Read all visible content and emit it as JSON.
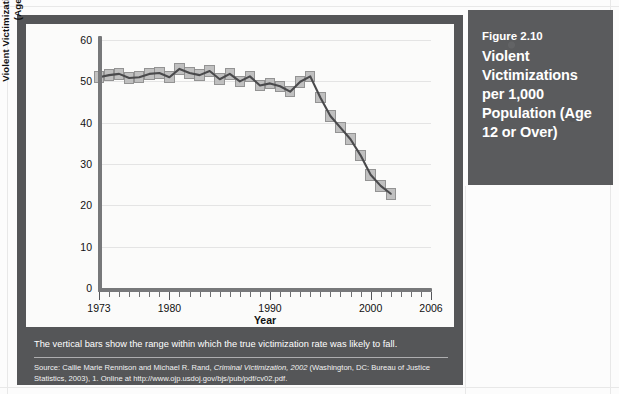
{
  "figure_label": {
    "number": "Figure 2.10",
    "title": "Violent Victimizations per 1,000 Population (Age 12 or Over)"
  },
  "caption": "The vertical bars show the range within which the true victimization rate was likely to fall.",
  "source": {
    "prefix": "Source: Callie Marie Rennison and Michael R. Rand, ",
    "italic": "Criminal Victimization, 2002",
    "suffix": " (Washington, DC: Bureau of Justice Statistics, 2003), 1. Online at http://www.ojp.usdoj.gov/bjs/pub/pdf/cv02.pdf."
  },
  "colors": {
    "panel": "#555658",
    "label_block": "#5a5b5d",
    "chart_background": "#fbfbfa",
    "axis": "#77787a",
    "gridline": "#e4e4e4",
    "bar_fill": "#bdbdbd",
    "bar_stroke": "#8e8e8e",
    "line": "#4a4a4c"
  },
  "chart_data": {
    "type": "line",
    "title": "",
    "xlabel": "Year",
    "ylabel": "Violent Victimizations per 1,000 Population (Age 12 or Over)",
    "ylabel_line1": "Violent Victimizations per 1,000 Population",
    "ylabel_line2": "(Age 12 or Over)",
    "xlim": [
      1973,
      2006
    ],
    "ylim": [
      0,
      60
    ],
    "ytick_values": [
      0,
      10,
      20,
      30,
      40,
      50,
      60
    ],
    "ytick_labels": [
      "0",
      "10",
      "20",
      "30",
      "40",
      "50",
      "60"
    ],
    "xtick_step": 1,
    "xtick_labeled": [
      1973,
      1980,
      1990,
      2000,
      2006
    ],
    "xtick_labels": [
      "1973",
      "1980",
      "1990",
      "2000",
      "2006"
    ],
    "grid": "horizontal",
    "legend": "none",
    "annotation": "The vertical bars show the range within which the true victimization rate was likely to fall.",
    "x": [
      1973,
      1974,
      1975,
      1976,
      1977,
      1978,
      1979,
      1980,
      1981,
      1982,
      1983,
      1984,
      1985,
      1986,
      1987,
      1988,
      1989,
      1990,
      1991,
      1992,
      1993,
      1994,
      1995,
      1996,
      1997,
      1998,
      1999,
      2000,
      2001,
      2002
    ],
    "values": [
      51.0,
      51.5,
      51.8,
      50.8,
      51.0,
      51.8,
      52.0,
      51.0,
      53.0,
      52.0,
      51.5,
      52.5,
      50.5,
      51.8,
      50.0,
      51.2,
      49.0,
      49.5,
      48.8,
      47.5,
      49.9,
      51.2,
      46.1,
      41.6,
      38.8,
      36.0,
      32.1,
      27.4,
      24.7,
      22.8
    ],
    "range_bars": [
      {
        "x": 1973,
        "low": 49.6,
        "high": 52.4
      },
      {
        "x": 1974,
        "low": 50.1,
        "high": 52.9
      },
      {
        "x": 1975,
        "low": 50.4,
        "high": 53.2
      },
      {
        "x": 1976,
        "low": 49.4,
        "high": 52.2
      },
      {
        "x": 1977,
        "low": 49.6,
        "high": 52.4
      },
      {
        "x": 1978,
        "low": 50.4,
        "high": 53.2
      },
      {
        "x": 1979,
        "low": 50.6,
        "high": 53.4
      },
      {
        "x": 1980,
        "low": 49.6,
        "high": 52.4
      },
      {
        "x": 1981,
        "low": 51.6,
        "high": 54.4
      },
      {
        "x": 1982,
        "low": 50.6,
        "high": 53.4
      },
      {
        "x": 1983,
        "low": 50.1,
        "high": 52.9
      },
      {
        "x": 1984,
        "low": 51.1,
        "high": 53.9
      },
      {
        "x": 1985,
        "low": 49.1,
        "high": 51.9
      },
      {
        "x": 1986,
        "low": 50.4,
        "high": 53.2
      },
      {
        "x": 1987,
        "low": 48.6,
        "high": 51.4
      },
      {
        "x": 1988,
        "low": 49.8,
        "high": 52.6
      },
      {
        "x": 1989,
        "low": 47.6,
        "high": 50.4
      },
      {
        "x": 1990,
        "low": 48.1,
        "high": 50.9
      },
      {
        "x": 1991,
        "low": 47.4,
        "high": 50.2
      },
      {
        "x": 1992,
        "low": 46.1,
        "high": 48.9
      },
      {
        "x": 1993,
        "low": 48.5,
        "high": 51.3
      },
      {
        "x": 1994,
        "low": 49.8,
        "high": 52.6
      },
      {
        "x": 1995,
        "low": 44.7,
        "high": 47.5
      },
      {
        "x": 1996,
        "low": 40.2,
        "high": 43.0
      },
      {
        "x": 1997,
        "low": 37.4,
        "high": 40.2
      },
      {
        "x": 1998,
        "low": 34.6,
        "high": 37.4
      },
      {
        "x": 1999,
        "low": 30.7,
        "high": 33.5
      },
      {
        "x": 2000,
        "low": 26.0,
        "high": 28.8
      },
      {
        "x": 2001,
        "low": 23.3,
        "high": 26.1
      },
      {
        "x": 2002,
        "low": 21.4,
        "high": 24.2
      }
    ]
  }
}
